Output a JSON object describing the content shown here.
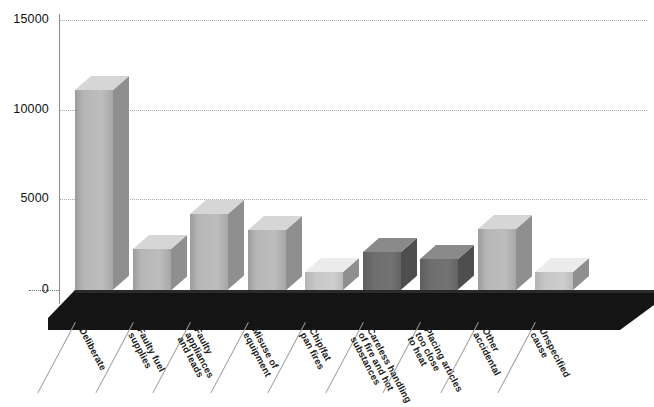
{
  "chart_data": {
    "type": "bar",
    "title": "",
    "subtitle": "",
    "xlabel": "",
    "ylabel": "",
    "ylim": [
      0,
      15000
    ],
    "yticks": [
      0,
      5000,
      10000,
      15000
    ],
    "ytick_labels": [
      "0",
      "5000",
      "10000",
      "15000"
    ],
    "grid": true,
    "legend": "none",
    "style": "3d-bar",
    "categories": [
      "Deliberate",
      "Faulty fuel supplies",
      "Faulty appliances and leads",
      "Misuse of equipment",
      "Chip/fat pan fires",
      "Careless handling of fire and hot substances",
      "Placing articles too close to heat",
      "Other accidental",
      "Unspecified cause"
    ],
    "category_lines": [
      [
        "Deliberate"
      ],
      [
        "Faulty fuel",
        "supplies"
      ],
      [
        "Faulty",
        "appliances",
        "and leads"
      ],
      [
        "Misuse of",
        "equipment"
      ],
      [
        "Chip/fat",
        "pan fires"
      ],
      [
        "Careless handling",
        "of fire and hot",
        "substances"
      ],
      [
        "Placing articles",
        "too close",
        "to heat"
      ],
      [
        "Other",
        "accidental"
      ],
      [
        "Unspecified",
        "cause"
      ]
    ],
    "values": [
      11100,
      2300,
      4200,
      3350,
      1000,
      2100,
      1700,
      3400,
      1000
    ],
    "bar_shade": [
      "light",
      "light",
      "light",
      "light",
      "bright",
      "dark",
      "dark",
      "light",
      "bright"
    ],
    "colors": {
      "bar_front": "#b6b6b6",
      "bar_side": "#8c8c8c",
      "bar_top": "#d2d2d2",
      "bar_front_dark": "#6e6e6e",
      "bar_front_bright": "#c8c8c8",
      "floor": "#1a1a1a",
      "gridline": "#a8a8a8",
      "axis": "#8d8d8d",
      "text": "#111111",
      "background": "#ffffff"
    }
  }
}
